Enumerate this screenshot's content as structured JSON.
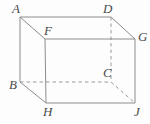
{
  "figure": {
    "type": "geometry-diagram",
    "shape_name": "rectangular-box",
    "background_color": "#fdfdfd",
    "solid_edge_color": "#8c8c8c",
    "hidden_edge_color": "#9a9a9a",
    "label_color": "#4a4a4a",
    "vertices": [
      {
        "id": "A",
        "label": "A",
        "x": 20,
        "y": 17,
        "label_x": 12,
        "label_y": 2,
        "hidden": false
      },
      {
        "id": "D",
        "label": "D",
        "x": 111,
        "y": 17,
        "label_x": 103,
        "label_y": 2,
        "hidden": false
      },
      {
        "id": "F",
        "label": "F",
        "x": 45,
        "y": 39,
        "label_x": 44,
        "label_y": 24,
        "hidden": false
      },
      {
        "id": "G",
        "label": "G",
        "x": 135,
        "y": 39,
        "label_x": 138,
        "label_y": 30,
        "hidden": false
      },
      {
        "id": "B",
        "label": "B",
        "x": 20,
        "y": 82,
        "label_x": 9,
        "label_y": 78,
        "hidden": false
      },
      {
        "id": "C",
        "label": "C",
        "x": 111,
        "y": 82,
        "label_x": 103,
        "label_y": 66,
        "hidden": true
      },
      {
        "id": "H",
        "label": "H",
        "x": 46,
        "y": 103,
        "label_x": 43,
        "label_y": 105,
        "hidden": false
      },
      {
        "id": "J",
        "label": "J",
        "x": 135,
        "y": 103,
        "label_x": 134,
        "label_y": 105,
        "hidden": false
      }
    ],
    "edges": [
      {
        "from": "A",
        "to": "D",
        "style": "solid",
        "name": "edge-A-D"
      },
      {
        "from": "A",
        "to": "B",
        "style": "solid",
        "name": "edge-A-B"
      },
      {
        "from": "A",
        "to": "F",
        "style": "solid",
        "name": "edge-A-F"
      },
      {
        "from": "D",
        "to": "G",
        "style": "solid",
        "name": "edge-D-G"
      },
      {
        "from": "D",
        "to": "C",
        "style": "dashed",
        "name": "edge-D-C"
      },
      {
        "from": "F",
        "to": "G",
        "style": "solid",
        "name": "edge-F-G"
      },
      {
        "from": "F",
        "to": "H",
        "style": "solid",
        "name": "edge-F-H"
      },
      {
        "from": "G",
        "to": "J",
        "style": "solid",
        "name": "edge-G-J"
      },
      {
        "from": "B",
        "to": "C",
        "style": "dashed",
        "name": "edge-B-C"
      },
      {
        "from": "B",
        "to": "H",
        "style": "solid",
        "name": "edge-B-H"
      },
      {
        "from": "C",
        "to": "J",
        "style": "dashed",
        "name": "edge-C-J"
      },
      {
        "from": "H",
        "to": "J",
        "style": "solid",
        "name": "edge-H-J"
      }
    ]
  }
}
